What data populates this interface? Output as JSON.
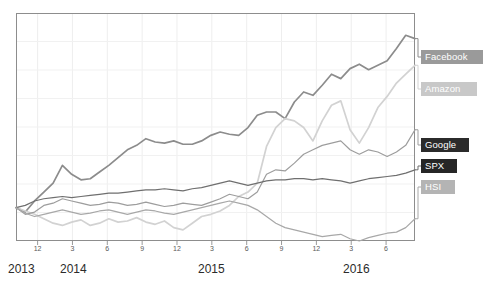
{
  "chart_data": {
    "type": "line",
    "title": "",
    "subtitle": "",
    "xlabel": "",
    "ylabel": "",
    "grid": true,
    "legend_position": "right-inline",
    "x_tick_labels": [
      "12",
      "3",
      "6",
      "9",
      "12",
      "3",
      "6",
      "9",
      "12",
      "3",
      "6"
    ],
    "x_year_labels": [
      "2013",
      "2014",
      "2015",
      "2016"
    ],
    "xlim": [
      0,
      44
    ],
    "ylim": [
      -30,
      175
    ],
    "note": "Indexed performance, values are percent change from the 2013 baseline read off the plotted curves",
    "series": [
      {
        "name": "Facebook",
        "color": "#8c8c8c",
        "label_bg": "#9a9a9a",
        "label_fg": "#ffffff",
        "values": [
          0,
          -4,
          6,
          14,
          22,
          38,
          30,
          25,
          26,
          32,
          38,
          45,
          52,
          56,
          62,
          59,
          58,
          60,
          57,
          57,
          60,
          65,
          68,
          66,
          65,
          72,
          83,
          86,
          86,
          80,
          95,
          104,
          101,
          110,
          120,
          116,
          125,
          129,
          124,
          128,
          132,
          143,
          155,
          152
        ]
      },
      {
        "name": "Amazon",
        "color": "#d2d2d2",
        "label_bg": "#c8c8c8",
        "label_fg": "#ffffff",
        "values": [
          0,
          -3,
          -6,
          -10,
          -14,
          -16,
          -13,
          -11,
          -16,
          -14,
          -10,
          -13,
          -12,
          -9,
          -13,
          -15,
          -12,
          -18,
          -20,
          -14,
          -8,
          -6,
          -3,
          2,
          10,
          14,
          22,
          55,
          72,
          80,
          78,
          72,
          60,
          78,
          92,
          96,
          70,
          58,
          72,
          90,
          100,
          112,
          120,
          128
        ]
      },
      {
        "name": "Google",
        "color": "#9d9d9d",
        "label_bg": "#2b2b2b",
        "label_fg": "#ffffff",
        "values": [
          0,
          -6,
          -4,
          2,
          4,
          8,
          6,
          4,
          2,
          3,
          5,
          4,
          2,
          3,
          5,
          3,
          1,
          2,
          4,
          3,
          2,
          5,
          8,
          12,
          10,
          8,
          14,
          30,
          34,
          33,
          40,
          48,
          52,
          56,
          58,
          60,
          52,
          48,
          52,
          50,
          46,
          50,
          56,
          70
        ]
      },
      {
        "name": "SPX",
        "color": "#6f6f6f",
        "label_bg": "#262626",
        "label_fg": "#ffffff",
        "values": [
          0,
          2,
          6,
          8,
          9,
          10,
          9,
          10,
          11,
          12,
          13,
          13,
          14,
          15,
          16,
          16,
          17,
          16,
          15,
          17,
          18,
          20,
          22,
          24,
          22,
          20,
          22,
          24,
          25,
          25,
          26,
          26,
          25,
          26,
          25,
          24,
          22,
          24,
          26,
          27,
          28,
          29,
          31,
          34
        ]
      },
      {
        "name": "HSI",
        "color": "#a8a8a8",
        "label_bg": "#b4b4b4",
        "label_fg": "#ffffff",
        "values": [
          0,
          -5,
          -8,
          -6,
          -4,
          -2,
          -4,
          -6,
          -5,
          -3,
          -2,
          -4,
          -6,
          -4,
          -2,
          -3,
          -5,
          -6,
          -4,
          -2,
          0,
          2,
          4,
          6,
          4,
          2,
          -2,
          -8,
          -14,
          -18,
          -20,
          -22,
          -24,
          -26,
          -25,
          -24,
          -28,
          -30,
          -27,
          -25,
          -23,
          -22,
          -18,
          -10
        ]
      }
    ]
  },
  "legend": {
    "items": [
      {
        "label": "Facebook"
      },
      {
        "label": "Amazon"
      },
      {
        "label": "Google"
      },
      {
        "label": "SPX"
      },
      {
        "label": "HSI"
      }
    ]
  },
  "axis": {
    "ticks": [
      {
        "label": "12"
      },
      {
        "label": "3"
      },
      {
        "label": "6"
      },
      {
        "label": "9"
      },
      {
        "label": "12"
      },
      {
        "label": "3"
      },
      {
        "label": "6"
      },
      {
        "label": "9"
      },
      {
        "label": "12"
      },
      {
        "label": "3"
      },
      {
        "label": "6"
      }
    ],
    "years": [
      {
        "label": "2013"
      },
      {
        "label": "2014"
      },
      {
        "label": "2015"
      },
      {
        "label": "2016"
      }
    ]
  }
}
